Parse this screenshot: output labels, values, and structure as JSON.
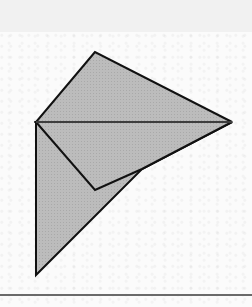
{
  "figure": {
    "fill_color": "#b9b9b9",
    "stroke_color": "#111111",
    "fold_line_color": "#6d6d6d",
    "background_color": "#fbfbfb",
    "header_color": "#f1f1f1",
    "vertices": {
      "A": [
        95,
        52
      ],
      "B": [
        36,
        122
      ],
      "C": [
        232,
        122
      ],
      "D": [
        95,
        190
      ],
      "E": [
        142,
        169
      ],
      "F": [
        36,
        275
      ]
    },
    "shapes": [
      {
        "name": "upper-triangle",
        "points": [
          "A",
          "B",
          "C"
        ]
      },
      {
        "name": "folded-flap",
        "points": [
          "B",
          "D",
          "E",
          "C"
        ]
      },
      {
        "name": "lower-triangle",
        "points": [
          "B",
          "F",
          "E",
          "C"
        ]
      }
    ],
    "fold_line": [
      "B",
      "C"
    ],
    "labels": []
  }
}
